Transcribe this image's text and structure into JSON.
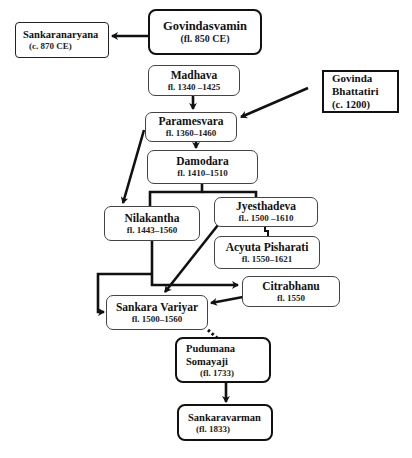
{
  "diagram": {
    "type": "lineage-chart",
    "nodes": {
      "govindasvamin": {
        "name": "Govindasvamin",
        "date": "(fl. 850 CE)"
      },
      "sankaranaryana": {
        "name": "Sankaranaryana",
        "date": "(c. 870 CE)"
      },
      "madhava": {
        "name": "Madhava",
        "date": "fl.  1340 –1425"
      },
      "govinda_bhattatiri": {
        "name_line1": "Govinda",
        "name_line2": "Bhattatiri",
        "date": "(c. 1200)"
      },
      "paramesvara": {
        "name": "Paramesvara",
        "date": "fl.  1360–1460"
      },
      "damodara": {
        "name": "Damodara",
        "date": "fl. 1410–1510"
      },
      "nilakantha": {
        "name": "Nilakantha",
        "date": "fl. 1443–1560"
      },
      "jyesthadeva": {
        "name": "Jyesthadeva",
        "date": "fl.. 1500 –1610"
      },
      "acyuta_pisharati": {
        "name": "Acyuta Pisharati",
        "date": "fl. 1550–1621"
      },
      "citrabhanu": {
        "name": "Citrabhanu",
        "date": "fl. 1550"
      },
      "sankara_variyar": {
        "name": "Sankara Variyar",
        "date": "fl. 1500–1560"
      },
      "pudumana_somayaji": {
        "name": "Pudumana Somayaji",
        "date": "(fl. 1733)"
      },
      "sankaravarman": {
        "name": "Sankaravarman",
        "date": "(fl. 1833)"
      }
    },
    "edges": [
      {
        "from": "Govindasvamin",
        "to": "Sankaranaryana",
        "style": "arrow"
      },
      {
        "from": "Madhava",
        "to": "Paramesvara",
        "style": "arrow"
      },
      {
        "from": "Govinda Bhattatiri",
        "to": "Paramesvara",
        "style": "arrow"
      },
      {
        "from": "Paramesvara",
        "to": "Damodara",
        "style": "arrow"
      },
      {
        "from": "Paramesvara",
        "to": "Nilakantha",
        "style": "arrow"
      },
      {
        "from": "Damodara",
        "to": "Nilakantha",
        "style": "line"
      },
      {
        "from": "Damodara",
        "to": "Jyesthadeva",
        "style": "line"
      },
      {
        "from": "Jyesthadeva",
        "to": "Acyuta Pisharati",
        "style": "line"
      },
      {
        "from": "Jyesthadeva",
        "to": "Sankara Variyar",
        "style": "arrow"
      },
      {
        "from": "Nilakantha",
        "to": "Sankara Variyar",
        "style": "arrow"
      },
      {
        "from": "Nilakantha",
        "to": "Citrabhanu",
        "style": "arrow"
      },
      {
        "from": "Citrabhanu",
        "to": "Sankara Variyar",
        "style": "arrow"
      },
      {
        "from": "Sankara Variyar",
        "to": "Pudumana Somayaji",
        "style": "dotted"
      },
      {
        "from": "Pudumana Somayaji",
        "to": "Sankaravarman",
        "style": "arrow"
      }
    ]
  }
}
